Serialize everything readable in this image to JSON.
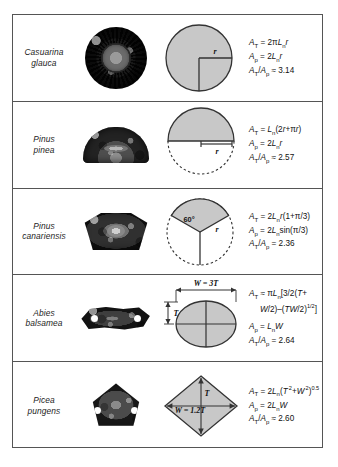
{
  "figure": {
    "colors": {
      "shape_fill": "#c8c8c8",
      "shape_stroke": "#333333",
      "border": "#555555"
    },
    "rows": [
      {
        "species": "Casuarina glauca",
        "species_line1": "Casuarina",
        "species_line2": "glauca",
        "photo": "circular-ribbed-stem-cross-section",
        "model": {
          "shape": "circle",
          "labels": [
            {
              "text": "r",
              "meaning": "radius"
            }
          ]
        },
        "equations": [
          {
            "lhs": "A",
            "lhs_sub": "T",
            "rel": "=",
            "rhs": "2πL",
            "rhs_sub": "n",
            "rhs_tail": "r"
          },
          {
            "lhs": "A",
            "lhs_sub": "p",
            "rel": "=",
            "rhs": "2L",
            "rhs_sub": "n",
            "rhs_tail": "r"
          },
          {
            "lhs": "A",
            "lhs_sub": "T",
            "rel": "≈",
            "ratio": "A",
            "ratio_sub": "p",
            "value": "3.14"
          }
        ]
      },
      {
        "species": "Pinus pinea",
        "species_line1": "Pinus",
        "species_line2": "pinea",
        "photo": "half-dome-needle-cross-section",
        "model": {
          "shape": "half-circle-with-dashed-lower-half",
          "labels": [
            {
              "text": "r",
              "meaning": "radius"
            }
          ]
        },
        "equations": [
          {
            "lhs": "A",
            "lhs_sub": "T",
            "rel": "=",
            "rhs": "L",
            "rhs_sub": "n",
            "rhs_tail": "(2r+πr)"
          },
          {
            "lhs": "A",
            "lhs_sub": "p",
            "rel": "=",
            "rhs": "2L",
            "rhs_sub": "n",
            "rhs_tail": "r"
          },
          {
            "lhs": "A",
            "lhs_sub": "T",
            "rel": "≈",
            "ratio": "A",
            "ratio_sub": "p",
            "value": "2.57"
          }
        ]
      },
      {
        "species": "Pinus canariensis",
        "species_line1": "Pinus",
        "species_line2": "canariensis",
        "photo": "fan-wedge-needle-cross-section",
        "model": {
          "shape": "circular-sector-60-degrees",
          "labels": [
            {
              "text": "60°",
              "meaning": "sector-angle"
            },
            {
              "text": "r",
              "meaning": "radius"
            }
          ]
        },
        "equations": [
          {
            "lhs": "A",
            "lhs_sub": "T",
            "rel": "=",
            "rhs": "2L",
            "rhs_sub": "n",
            "rhs_tail": "r(1+π/3)"
          },
          {
            "lhs": "A",
            "lhs_sub": "p",
            "rel": "=",
            "rhs": "2L",
            "rhs_sub": "n",
            "rhs_tail": "sin(π/3)"
          },
          {
            "lhs": "A",
            "lhs_sub": "T",
            "rel": "=",
            "ratio": "A",
            "ratio_sub": "p",
            "value": "2.36"
          }
        ]
      },
      {
        "species": "Abies balsamea",
        "species_line1": "Abies",
        "species_line2": "balsamea",
        "photo": "flat-lobed-needle-cross-section",
        "model": {
          "shape": "ellipse",
          "labels": [
            {
              "text": "W = 3T",
              "meaning": "width-relation"
            },
            {
              "text": "T",
              "meaning": "thickness"
            }
          ]
        },
        "equations": [
          {
            "text": "A_T ≈ πL_n[3/2(T+W/2)–(TW/2)^1/2]",
            "line1": "A",
            "line1_sub": "T",
            "rel": "≈",
            "line1_rhs": "πL",
            "line1_rhs_sub": "n",
            "line1_tail": "[3/2(T+",
            "line2": "W/2)–(TW/2)",
            "line2_sup": "1/2",
            "line2_tail": "]"
          },
          {
            "lhs": "A",
            "lhs_sub": "p",
            "rel": "=",
            "rhs": "L",
            "rhs_sub": "n",
            "rhs_tail": "W"
          },
          {
            "lhs": "A",
            "lhs_sub": "T",
            "rel": "=",
            "ratio": "A",
            "ratio_sub": "p",
            "value": "2.64"
          }
        ]
      },
      {
        "species": "Picea pungens",
        "species_line1": "Picea",
        "species_line2": "pungens",
        "photo": "diamond-kite-needle-cross-section",
        "model": {
          "shape": "rhombus",
          "labels": [
            {
              "text": "T",
              "meaning": "thickness"
            },
            {
              "text": "W = 1.2T",
              "meaning": "width-relation"
            }
          ]
        },
        "equations": [
          {
            "lhs": "A",
            "lhs_sub": "T",
            "rel": "=",
            "rhs": "2L",
            "rhs_sub": "n",
            "rhs_tail": "(T",
            "sup1": "2",
            "mid": "+W",
            "sup2": "2",
            "sup3": "0.5"
          },
          {
            "lhs": "A",
            "lhs_sub": "p",
            "rel": "=",
            "rhs": "2L",
            "rhs_sub": "n",
            "rhs_tail": "W"
          },
          {
            "lhs": "A",
            "lhs_sub": "T",
            "rel": "≈",
            "ratio": "A",
            "ratio_sub": "p",
            "value": "2.60"
          }
        ]
      }
    ],
    "labels": {
      "r": "r",
      "T": "T",
      "angle60": "60°",
      "w_eq_3t": "W = 3T",
      "w_eq_12t": "W = 1.2T"
    }
  }
}
